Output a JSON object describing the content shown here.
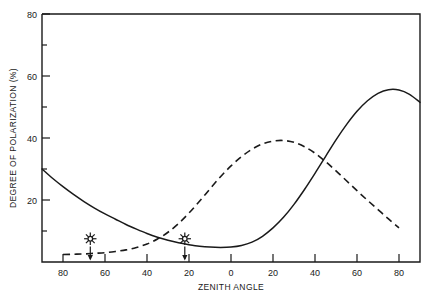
{
  "chart_data": {
    "type": "line",
    "title": "",
    "xlabel": "ZENITH ANGLE",
    "ylabel": "DEGREE OF POLARIZATION (%)",
    "xlim": [
      -90,
      90
    ],
    "ylim": [
      0,
      80
    ],
    "grid": false,
    "legend_position": "none",
    "x_tick_labels": [
      "80",
      "60",
      "40",
      "20",
      "0",
      "20",
      "40",
      "60",
      "80"
    ],
    "x_tick_values": [
      -80,
      -60,
      -40,
      -20,
      0,
      20,
      40,
      60,
      80
    ],
    "y_tick_labels": [
      "20",
      "40",
      "60",
      "80"
    ],
    "y_tick_values": [
      20,
      40,
      60,
      80
    ],
    "y_minor_tick_values": [
      10,
      30,
      50,
      70
    ],
    "series": [
      {
        "name": "solid-curve",
        "style": "solid",
        "x": [
          -90,
          -85,
          -80,
          -75,
          -70,
          -65,
          -60,
          -55,
          -50,
          -45,
          -40,
          -35,
          -30,
          -25,
          -20,
          -15,
          -10,
          -5,
          0,
          5,
          10,
          15,
          20,
          25,
          30,
          35,
          40,
          45,
          50,
          55,
          60,
          65,
          70,
          75,
          80,
          85,
          90
        ],
        "y": [
          30.0,
          27.0,
          24.3,
          21.8,
          19.5,
          17.4,
          15.5,
          13.8,
          12.1,
          10.6,
          9.2,
          8.0,
          7.0,
          6.2,
          5.6,
          5.1,
          4.8,
          4.7,
          4.8,
          5.3,
          6.4,
          8.3,
          11.0,
          14.4,
          18.6,
          23.4,
          28.6,
          34.0,
          39.4,
          44.3,
          48.6,
          52.0,
          54.4,
          55.6,
          55.5,
          54.1,
          51.5
        ]
      },
      {
        "name": "dashed-curve",
        "style": "dashed",
        "x": [
          -80,
          -75,
          -70,
          -65,
          -60,
          -55,
          -50,
          -45,
          -40,
          -35,
          -30,
          -25,
          -20,
          -15,
          -10,
          -5,
          0,
          5,
          10,
          15,
          20,
          25,
          30,
          35,
          40,
          45,
          50,
          55,
          60,
          65,
          70,
          75,
          80
        ],
        "y": [
          2.4,
          2.5,
          2.6,
          2.8,
          3.0,
          3.4,
          3.9,
          4.7,
          5.8,
          7.4,
          9.6,
          12.4,
          15.8,
          19.6,
          23.6,
          27.5,
          31.0,
          34.0,
          36.4,
          38.1,
          39.0,
          39.2,
          38.6,
          37.2,
          35.1,
          32.4,
          29.4,
          26.2,
          23.0,
          19.9,
          16.9,
          13.9,
          11.0
        ]
      }
    ],
    "annotations": [
      {
        "name": "sun-marker-left",
        "icon": "sun-icon",
        "x": -67,
        "y": 7.5,
        "arrow": "down"
      },
      {
        "name": "sun-marker-right",
        "icon": "sun-icon",
        "x": -22,
        "y": 7.5,
        "arrow": "down"
      }
    ]
  }
}
